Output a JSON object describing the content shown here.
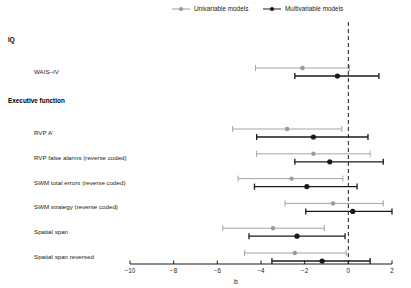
{
  "legend": {
    "position": "top-center",
    "entries": [
      {
        "label": "Univariable models",
        "color": "#9a9a9a",
        "marker": "circle"
      },
      {
        "label": "Multivariable models",
        "color": "#1a1a1a",
        "marker": "circle"
      }
    ]
  },
  "axis": {
    "title": "b",
    "ticks": [
      -10,
      -8,
      -6,
      -4,
      -2,
      0,
      2
    ],
    "tick_labels": [
      "−10",
      "−8",
      "−6",
      "−4",
      "−2",
      "0",
      "2"
    ],
    "xlim": [
      -10,
      2
    ],
    "reference_line": 0,
    "reference_line_style": "dashed",
    "grid": false
  },
  "chart_data": {
    "type": "scatter",
    "plot_style": "forest-plot",
    "title": "",
    "xlabel": "b",
    "ylabel": "",
    "xlim": [
      -10,
      2
    ],
    "grid": false,
    "reference_line": 0,
    "legend_position": "top-center",
    "series": [
      {
        "name": "Univariable models",
        "color": "#9a9a9a"
      },
      {
        "name": "Multivariable models",
        "color": "#1a1a1a"
      }
    ],
    "groups": [
      {
        "header": "IQ",
        "rows": [
          {
            "label": "WAIS–IV",
            "univariable": {
              "estimate": -2.1,
              "ci_low": -4.25,
              "ci_high": 0.05
            },
            "multivariable": {
              "estimate": -0.5,
              "ci_low": -2.45,
              "ci_high": 1.4
            }
          }
        ]
      },
      {
        "header": "Executive function",
        "rows": [
          {
            "label": "RVP A'",
            "univariable": {
              "estimate": -2.8,
              "ci_low": -5.3,
              "ci_high": -0.3
            },
            "multivariable": {
              "estimate": -1.6,
              "ci_low": -4.2,
              "ci_high": 0.9
            }
          },
          {
            "label": "RVP false alarms (reverse coded)",
            "univariable": {
              "estimate": -1.6,
              "ci_low": -4.2,
              "ci_high": 1.0
            },
            "multivariable": {
              "estimate": -0.85,
              "ci_low": -2.45,
              "ci_high": 1.6
            }
          },
          {
            "label": "SWM total errors (reverse coded)",
            "univariable": {
              "estimate": -2.6,
              "ci_low": -5.05,
              "ci_high": -0.25
            },
            "multivariable": {
              "estimate": -1.9,
              "ci_low": -4.3,
              "ci_high": 0.4
            }
          },
          {
            "label": "SWM strategy (reverse coded)",
            "univariable": {
              "estimate": -0.7,
              "ci_low": -2.9,
              "ci_high": 1.6
            },
            "multivariable": {
              "estimate": 0.2,
              "ci_low": -1.95,
              "ci_high": 2.4
            }
          },
          {
            "label": "Spatial span",
            "univariable": {
              "estimate": -3.45,
              "ci_low": -5.75,
              "ci_high": -1.1
            },
            "multivariable": {
              "estimate": -2.35,
              "ci_low": -4.55,
              "ci_high": -0.15
            }
          },
          {
            "label": "Spatial span reversed",
            "univariable": {
              "estimate": -2.45,
              "ci_low": -4.75,
              "ci_high": -0.1
            },
            "multivariable": {
              "estimate": -1.2,
              "ci_low": -3.5,
              "ci_high": 1.0
            }
          }
        ]
      }
    ]
  }
}
